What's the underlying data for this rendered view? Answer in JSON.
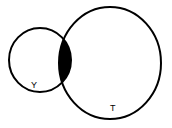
{
  "diagram": {
    "type": "venn",
    "sets": [
      {
        "label": "Y",
        "cx": 40,
        "cy": 60,
        "rx": 31,
        "ry": 32
      },
      {
        "label": "T",
        "cx": 110,
        "cy": 63,
        "rx": 51,
        "ry": 56
      }
    ],
    "shaded_region": "Y ∩ T",
    "colors": {
      "stroke": "#000000",
      "shade": "#000000",
      "background": "#ffffff"
    }
  }
}
